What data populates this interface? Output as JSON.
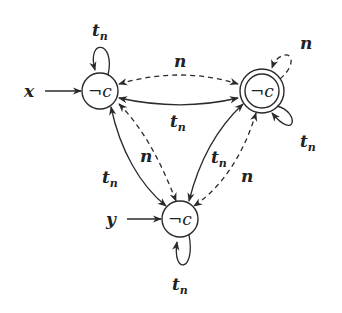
{
  "diagram": {
    "type": "state-transition-graph",
    "colors": {
      "stroke": "#2a2a2a",
      "text": "#222222",
      "background": "#ffffff"
    },
    "nodes": [
      {
        "id": "A",
        "label": "¬c",
        "accepting": false,
        "position": "top-left"
      },
      {
        "id": "B",
        "label": "¬c",
        "accepting": true,
        "position": "top-right"
      },
      {
        "id": "C",
        "label": "¬c",
        "accepting": false,
        "position": "bottom"
      }
    ],
    "inputs": [
      {
        "label": "x",
        "target": "A"
      },
      {
        "label": "y",
        "target": "C"
      }
    ],
    "edges": [
      {
        "from": "A",
        "to": "A",
        "label_main": "t",
        "label_sub": "n",
        "style": "solid"
      },
      {
        "from": "B",
        "to": "B",
        "label_main": "t",
        "label_sub": "n",
        "style": "solid"
      },
      {
        "from": "B",
        "to": "B",
        "label": "n",
        "style": "dashed"
      },
      {
        "from": "C",
        "to": "C",
        "label_main": "t",
        "label_sub": "n",
        "style": "solid"
      },
      {
        "from": "A",
        "to": "B",
        "label": "n",
        "style": "dashed",
        "bidirectional": true
      },
      {
        "from": "A",
        "to": "B",
        "label_main": "t",
        "label_sub": "n",
        "style": "solid",
        "bidirectional": true
      },
      {
        "from": "A",
        "to": "C",
        "label_main": "t",
        "label_sub": "n",
        "style": "solid",
        "bidirectional": true
      },
      {
        "from": "A",
        "to": "C",
        "label": "n",
        "style": "dashed",
        "bidirectional": true
      },
      {
        "from": "B",
        "to": "C",
        "label_main": "t",
        "label_sub": "n",
        "style": "solid",
        "bidirectional": true
      },
      {
        "from": "B",
        "to": "C",
        "label": "n",
        "style": "dashed",
        "bidirectional": true
      }
    ],
    "labels": {
      "node_a": "¬c",
      "node_b": "¬c",
      "node_c": "¬c",
      "input_x": "x",
      "input_y": "y",
      "t": "t",
      "n_sub": "n",
      "n": "n"
    }
  }
}
